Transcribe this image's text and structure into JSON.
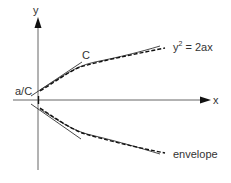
{
  "diagram": {
    "labels": {
      "y_axis": "y",
      "x_axis": "x",
      "tangent": "C",
      "intercept": "a/C",
      "equation_base": "y",
      "equation_exp": "2",
      "equation_rest": " = 2ax",
      "envelope": "envelope"
    },
    "colors": {
      "axis": "#555555",
      "curve": "#222222",
      "tangent": "#333333",
      "text": "#333333"
    }
  }
}
